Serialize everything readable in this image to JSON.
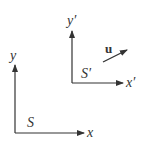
{
  "diagram": {
    "frame_s": {
      "name": "S",
      "x_axis_label": "x",
      "y_axis_label": "y"
    },
    "frame_s_prime": {
      "name": "S′",
      "x_axis_label": "x′",
      "y_axis_label": "y′"
    },
    "velocity": {
      "label": "u"
    },
    "colors": {
      "line": "#333333",
      "background": "#ffffff"
    }
  }
}
